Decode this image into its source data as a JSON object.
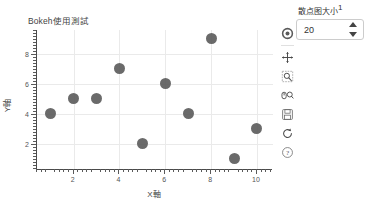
{
  "chart_data": {
    "type": "scatter",
    "title": "Bokeh使用測試",
    "xlabel": "X軸",
    "ylabel": "Y軸",
    "x": [
      1,
      2,
      3,
      4,
      5,
      6,
      7,
      8,
      9,
      10
    ],
    "y": [
      4,
      5,
      5,
      7,
      2,
      6,
      4,
      9,
      1,
      3
    ],
    "xlim": [
      0.4,
      10.7
    ],
    "ylim": [
      0.3,
      9.6
    ],
    "xticks": [
      2,
      4,
      6,
      8,
      10
    ],
    "yticks": [
      2,
      4,
      6,
      8
    ],
    "xtick_labels": [
      "2",
      "4",
      "6",
      "8",
      "10"
    ],
    "ytick_labels": [
      "2",
      "4",
      "6",
      "8"
    ],
    "grid": true,
    "legend": "none",
    "marker_color": "#555555",
    "marker_size": 20,
    "grid_color": "#eaeaea",
    "axis_color": "#4a4a4a"
  },
  "toolbar": {
    "tools": [
      {
        "name": "bokeh-logo-icon",
        "label": "Bokeh"
      },
      {
        "name": "pan-tool-icon",
        "label": "Pan"
      },
      {
        "name": "box-zoom-tool-icon",
        "label": "Box Zoom"
      },
      {
        "name": "wheel-zoom-tool-icon",
        "label": "Wheel Zoom"
      },
      {
        "name": "save-tool-icon",
        "label": "Save"
      },
      {
        "name": "reset-tool-icon",
        "label": "Reset"
      },
      {
        "name": "help-tool-icon",
        "label": "Help"
      }
    ]
  },
  "widget": {
    "label": "散点图大小",
    "footnote": "1",
    "value": "20",
    "placeholder": "20"
  }
}
